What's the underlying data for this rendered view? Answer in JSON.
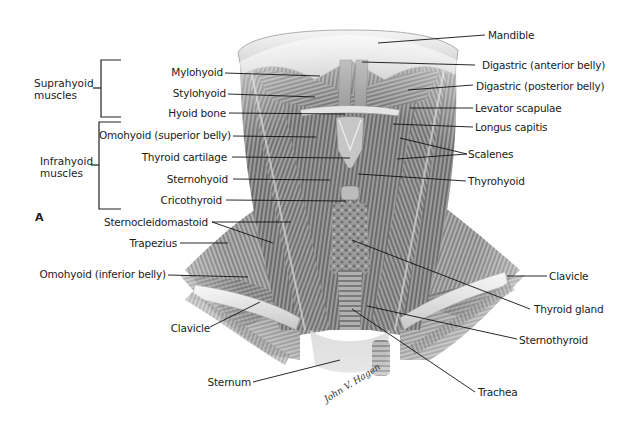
{
  "figure": {
    "panel_letter": "A",
    "signature": "John V. Hagen",
    "colors": {
      "background": "#ffffff",
      "label_text": "#1c1c1c",
      "leader_line": "#111111",
      "muscle_dark": "#5a5a5a",
      "muscle_light": "#bdbdbd",
      "bone": "#e6e6e6"
    }
  },
  "groups": [
    {
      "id": "suprahyoid",
      "line1": "Suprahyoid",
      "line2": "muscles"
    },
    {
      "id": "infrahyoid",
      "line1": "Infrahyoid",
      "line2": "muscles"
    }
  ],
  "labels_left": [
    {
      "id": "mylohyoid",
      "text": "Mylohyoid"
    },
    {
      "id": "stylohyoid",
      "text": "Stylohyoid"
    },
    {
      "id": "hyoid-bone",
      "text": "Hyoid bone"
    },
    {
      "id": "omohyoid-superior",
      "text": "Omohyoid (superior belly)"
    },
    {
      "id": "thyroid-cartilage",
      "text": "Thyroid cartilage"
    },
    {
      "id": "sternohyoid",
      "text": "Sternohyoid"
    },
    {
      "id": "cricothyroid",
      "text": "Cricothyroid"
    },
    {
      "id": "sternocleidomastoid",
      "text": "Sternocleidomastoid"
    },
    {
      "id": "trapezius",
      "text": "Trapezius"
    },
    {
      "id": "omohyoid-inferior",
      "text": "Omohyoid (inferior belly)"
    },
    {
      "id": "clavicle-left",
      "text": "Clavicle"
    },
    {
      "id": "sternum",
      "text": "Sternum"
    }
  ],
  "labels_right": [
    {
      "id": "mandible",
      "text": "Mandible"
    },
    {
      "id": "digastric-anterior",
      "text": "Digastric (anterior belly)"
    },
    {
      "id": "digastric-posterior",
      "text": "Digastric (posterior belly)"
    },
    {
      "id": "levator-scapulae",
      "text": "Levator scapulae"
    },
    {
      "id": "longus-capitis",
      "text": "Longus capitis"
    },
    {
      "id": "scalenes",
      "text": "Scalenes"
    },
    {
      "id": "thyrohyoid",
      "text": "Thyrohyoid"
    },
    {
      "id": "clavicle-right",
      "text": "Clavicle"
    },
    {
      "id": "thyroid-gland",
      "text": "Thyroid gland"
    },
    {
      "id": "sternothyroid",
      "text": "Sternothyroid"
    },
    {
      "id": "trachea",
      "text": "Trachea"
    }
  ]
}
